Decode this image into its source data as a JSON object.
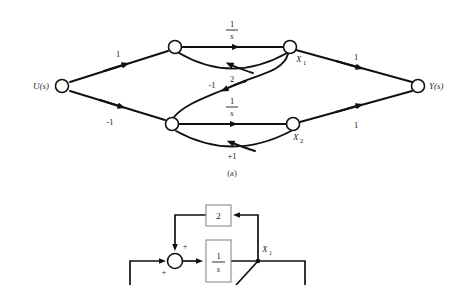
{
  "figure": {
    "caption_a": "(a)",
    "panel_a": {
      "type": "signal-flow-graph",
      "nodes": [
        {
          "id": "u",
          "label": "U(s)",
          "x": 62,
          "y": 86,
          "label_side": "left"
        },
        {
          "id": "n1",
          "label": "",
          "x": 175,
          "y": 47,
          "label_side": "none"
        },
        {
          "id": "x1",
          "label": "X",
          "sub": "1",
          "x": 290,
          "y": 47,
          "label_side": "below-right"
        },
        {
          "id": "n2",
          "label": "",
          "x": 172,
          "y": 124,
          "label_side": "none"
        },
        {
          "id": "x2",
          "label": "X",
          "sub": "2",
          "x": 293,
          "y": 124,
          "label_side": "below-right"
        },
        {
          "id": "y",
          "label": "Y(s)",
          "x": 418,
          "y": 86,
          "label_side": "right"
        }
      ],
      "edges": [
        {
          "from": "u",
          "to": "n1",
          "gain": "1",
          "label_x": 118,
          "label_y": 54,
          "kind": "straight"
        },
        {
          "from": "u",
          "to": "n2",
          "gain": "-1",
          "label_x": 110,
          "label_y": 122,
          "kind": "straight"
        },
        {
          "from": "n1",
          "to": "x1",
          "gain": "1/s",
          "label_x": 232,
          "label_y": 28,
          "kind": "straight",
          "fraction": true,
          "num": "1",
          "den": "s"
        },
        {
          "from": "x1",
          "to": "n1",
          "gain": "2",
          "label_x": 232,
          "label_y": 78,
          "kind": "arc-below"
        },
        {
          "from": "n2",
          "to": "x2",
          "gain": "1/s",
          "label_x": 232,
          "label_y": 105,
          "kind": "straight",
          "fraction": true,
          "num": "1",
          "den": "s"
        },
        {
          "from": "x2",
          "to": "n2",
          "gain": "+1",
          "label_x": 232,
          "label_y": 155,
          "kind": "arc-below"
        },
        {
          "from": "x1",
          "to": "n2",
          "gain": "-1",
          "label_x": 214,
          "label_y": 85,
          "kind": "s-curve"
        },
        {
          "from": "x1",
          "to": "y",
          "gain": "1",
          "label_x": 356,
          "label_y": 57,
          "kind": "straight"
        },
        {
          "from": "x2",
          "to": "y",
          "gain": "1",
          "label_x": 356,
          "label_y": 124,
          "kind": "straight"
        }
      ]
    },
    "panel_b": {
      "type": "block-diagram",
      "blocks": [
        {
          "id": "gain2",
          "label": "2",
          "x": 206,
          "y": 205,
          "w": 25,
          "h": 21
        },
        {
          "id": "int1",
          "label": "1/s",
          "x": 206,
          "y": 240,
          "w": 25,
          "h": 42,
          "fraction": true,
          "num": "1",
          "den": "s"
        }
      ],
      "summers": [
        {
          "id": "sum1",
          "cx": 175,
          "cy": 261,
          "r": 7.5,
          "signs": [
            {
              "text": "+",
              "x": 185,
              "y": 247
            },
            {
              "text": "+",
              "x": 164,
              "y": 272
            }
          ]
        }
      ],
      "labels": [
        {
          "text": "X",
          "sub": "1",
          "x": 265,
          "y": 250
        }
      ]
    }
  }
}
